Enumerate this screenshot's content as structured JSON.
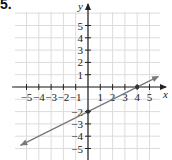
{
  "problem_label": "5.",
  "chart_data": {
    "type": "line",
    "title": "",
    "xlabel": "x",
    "ylabel": "y",
    "xlim": [
      -5.5,
      5.8
    ],
    "ylim": [
      -5.5,
      6.3
    ],
    "grid": true,
    "x_ticks": [
      -5,
      -4,
      -3,
      -2,
      -1,
      1,
      2,
      3,
      4,
      5
    ],
    "y_ticks": [
      5,
      4,
      3,
      2,
      1,
      -2,
      -3,
      -4,
      -5
    ],
    "x_tick_labels": [
      "−5",
      "−4",
      "−3",
      "−2",
      "−1",
      "1",
      "2",
      "3",
      "4",
      "5"
    ],
    "y_tick_labels": [
      "5",
      "4",
      "3",
      "2",
      "1",
      "−2",
      "−3",
      "−4",
      "−5"
    ],
    "series": [
      {
        "name": "line",
        "equation": "y = 0.5x - 2",
        "x": [
          -5.5,
          5.7
        ],
        "y": [
          -4.75,
          0.85
        ],
        "arrows": "both",
        "color": "#7a7a7a"
      }
    ],
    "points": [
      {
        "x": 0,
        "y": -2,
        "label": "y-intercept"
      },
      {
        "x": 4,
        "y": 0,
        "label": "x-intercept"
      }
    ]
  }
}
